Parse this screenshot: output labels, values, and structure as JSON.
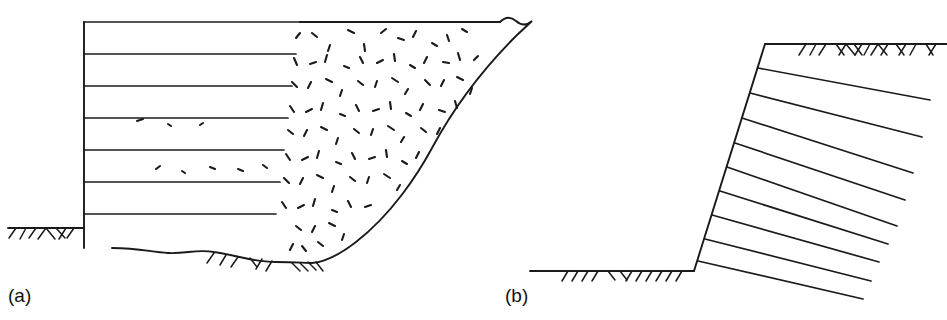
{
  "figure": {
    "kind": "engineering-cross-section-diagram",
    "stroke_color": "#1a1a1a",
    "fill_color": "#000000",
    "background_color": "#ffffff",
    "panels": [
      {
        "id": "a",
        "label": "(a)",
        "caption_position": {
          "x": 8,
          "y": 285
        },
        "wall": {
          "type": "vertical-faced-reinforced-wall",
          "face_x": 84,
          "top_y": 22,
          "base_y": 246,
          "height_px": 224
        },
        "footing": {
          "shape": "rectangle",
          "filled": true,
          "x": 65,
          "y": 245,
          "width": 47,
          "height": 22
        },
        "reinforcement_layers": {
          "count": 7,
          "orientation": "horizontal",
          "start_x": 84,
          "y_values": [
            22,
            54,
            86,
            118,
            150,
            182,
            214
          ],
          "end_x_values": [
            300,
            296,
            292,
            288,
            284,
            280,
            276
          ]
        },
        "ground_surface_left": {
          "y": 228,
          "from_x": 8,
          "to_x": 84,
          "hatched": true
        },
        "ground_surface_base": {
          "y": 262,
          "from_x": 112,
          "to_x": 330,
          "undulating": true,
          "hatched": true
        },
        "backfill_region": {
          "texture": "random-dashes",
          "symbol": "granular-fill",
          "dash_count": 86
        },
        "slope_profile": {
          "type": "s-curve",
          "crest_x": 520,
          "crest_y": 20,
          "toe_x": 312,
          "toe_y": 262
        }
      },
      {
        "id": "b",
        "label": "(b)",
        "caption_position": {
          "x": 505,
          "y": 285
        },
        "wall": {
          "type": "battered-faced-reinforced-slope",
          "top_x": 765,
          "top_y": 44,
          "toe_x": 694,
          "toe_y": 271,
          "batter": "inclined"
        },
        "reinforcement_layers": {
          "count": 9,
          "orientation": "inclined-downward-right",
          "slope_deg": 11
        },
        "ground_surface_crest": {
          "y": 44,
          "from_x": 765,
          "to_x": 947,
          "hatched": true
        },
        "ground_surface_toe": {
          "y": 271,
          "from_x": 530,
          "to_x": 694,
          "hatched": true
        }
      }
    ]
  }
}
